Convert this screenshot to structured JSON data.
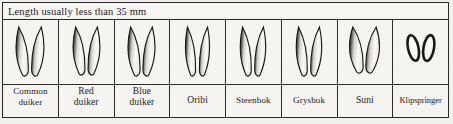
{
  "header": {
    "note": "Length usually less than 35 mm"
  },
  "colors": {
    "ink": "#2b2a28",
    "paper": "#f6f5f2",
    "hoof_dark": "#1b1a18",
    "hoof_light": "#fbfaf7"
  },
  "chart_data": {
    "type": "table",
    "title": "Length usually less than 35 mm",
    "caption": "Small antelope hoof prints (spoor) comparison chart",
    "columns": [
      "species",
      "spoor"
    ],
    "categories": [
      "Common duiker",
      "Red duiker",
      "Blue duiker",
      "Oribi",
      "Steenbok",
      "Grysbok",
      "Suni",
      "Klipspringer"
    ],
    "rows": [
      {
        "label": "Common\nduiker",
        "label_lines": [
          "Common",
          "duiker"
        ],
        "spoor_type": "cloven-teardrop",
        "lobes": 2,
        "width": 26,
        "height": 50,
        "splay": 3.1,
        "taper": 0.7,
        "label_style": "mid"
      },
      {
        "label": "Red\nduiker",
        "label_lines": [
          "Red",
          "duiker"
        ],
        "spoor_type": "cloven-teardrop",
        "lobes": 2,
        "width": 25,
        "height": 49,
        "splay": 3.0,
        "taper": 0.7,
        "label_style": "normal"
      },
      {
        "label": "Blue\nduiker",
        "label_lines": [
          "Blue",
          "duiker"
        ],
        "spoor_type": "cloven-teardrop",
        "lobes": 2,
        "width": 25,
        "height": 50,
        "splay": 2.8,
        "taper": 0.72,
        "label_style": "normal"
      },
      {
        "label": "Oribi",
        "label_lines": [
          "Oribi"
        ],
        "spoor_type": "cloven-teardrop",
        "lobes": 2,
        "width": 23,
        "height": 50,
        "splay": 3.6,
        "taper": 0.62,
        "label_style": "normal"
      },
      {
        "label": "Steenbok",
        "label_lines": [
          "Steenbok"
        ],
        "spoor_type": "cloven-teardrop",
        "lobes": 2,
        "width": 24,
        "height": 50,
        "splay": 3.2,
        "taper": 0.66,
        "label_style": "mid"
      },
      {
        "label": "Grysbok",
        "label_lines": [
          "Grysbok"
        ],
        "spoor_type": "cloven-teardrop",
        "lobes": 2,
        "width": 24,
        "height": 50,
        "splay": 3.2,
        "taper": 0.66,
        "label_style": "mid"
      },
      {
        "label": "Suni",
        "label_lines": [
          "Suni"
        ],
        "spoor_type": "cloven-teardrop",
        "lobes": 2,
        "width": 27,
        "height": 47,
        "splay": 2.6,
        "taper": 0.8,
        "label_style": "normal"
      },
      {
        "label": "Klipspringer",
        "label_lines": [
          "Klipspringer"
        ],
        "spoor_type": "rounded-oval",
        "lobes": 2,
        "width": 26,
        "height": 26,
        "splay": 5.0,
        "taper": 1.0,
        "label_style": "small"
      }
    ]
  }
}
